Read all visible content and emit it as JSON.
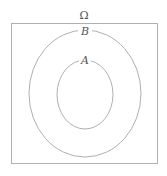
{
  "diagram": {
    "type": "venn",
    "universe": {
      "label": "Ω"
    },
    "sets": [
      {
        "label": "B",
        "contains": [
          "A"
        ]
      },
      {
        "label": "A"
      }
    ],
    "stroke_color": "#aaaaaa"
  }
}
